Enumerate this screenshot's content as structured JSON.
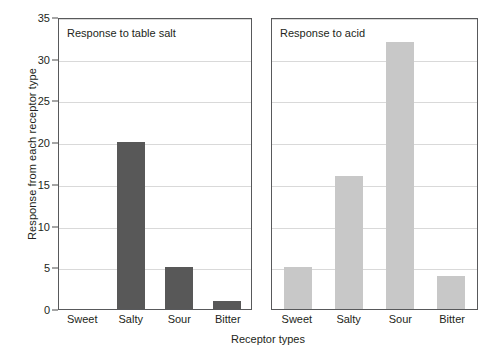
{
  "chart_data": {
    "type": "bar",
    "title": "",
    "xlabel": "Receptor types",
    "ylabel": "Response from each receptor type",
    "ylim": [
      0,
      35
    ],
    "yticks": [
      0,
      5,
      10,
      15,
      20,
      25,
      30,
      35
    ],
    "grid": true,
    "legend": "none",
    "categories": [
      "Sweet",
      "Salty",
      "Sour",
      "Bitter"
    ],
    "panels": [
      {
        "title": "Response to table salt",
        "bar_color": "#585858",
        "values": [
          0,
          20,
          5,
          1
        ]
      },
      {
        "title": "Response to acid",
        "bar_color": "#c8c8c8",
        "values": [
          5,
          16,
          32,
          4
        ]
      }
    ]
  },
  "axes": {
    "y_title": "Response from each receptor type",
    "x_title": "Receptor types",
    "y_ticks": [
      "0",
      "5",
      "10",
      "15",
      "20",
      "25",
      "30",
      "35"
    ]
  },
  "panel_left": {
    "title": "Response to table salt",
    "categories": [
      "Sweet",
      "Salty",
      "Sour",
      "Bitter"
    ],
    "values": [
      0,
      20,
      5,
      1
    ]
  },
  "panel_right": {
    "title": "Response to acid",
    "categories": [
      "Sweet",
      "Salty",
      "Sour",
      "Bitter"
    ],
    "values": [
      5,
      16,
      32,
      4
    ]
  },
  "colors": {
    "bar_dark": "#585858",
    "bar_light": "#c8c8c8",
    "gridline": "#d9d9d9",
    "frame": "#58595b",
    "text": "#231f20",
    "background": "#ffffff"
  }
}
